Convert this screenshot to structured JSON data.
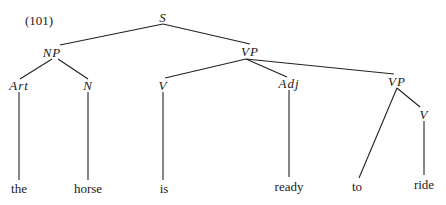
{
  "example_number": "(101)",
  "nodes": {
    "S": {
      "label": "S",
      "x": 163,
      "y": 17
    },
    "NP": {
      "label": "NP",
      "x": 52,
      "y": 52
    },
    "VP1": {
      "label": "VP",
      "x": 250,
      "y": 51
    },
    "Art": {
      "label": "Art",
      "x": 19,
      "y": 85
    },
    "N": {
      "label": "N",
      "x": 88,
      "y": 85
    },
    "V1": {
      "label": "V",
      "x": 163,
      "y": 85
    },
    "Adj": {
      "label": "Adj",
      "x": 289,
      "y": 83
    },
    "VP2": {
      "label": "VP",
      "x": 397,
      "y": 81
    },
    "V2": {
      "label": "V",
      "x": 424,
      "y": 114
    }
  },
  "leaves": {
    "the": {
      "label": "the",
      "x": 19,
      "y": 188
    },
    "horse": {
      "label": "horse",
      "x": 88,
      "y": 188
    },
    "is": {
      "label": "is",
      "x": 164,
      "y": 188
    },
    "ready": {
      "label": "ready",
      "x": 289,
      "y": 186
    },
    "to": {
      "label": "to",
      "x": 357,
      "y": 186
    },
    "ride": {
      "label": "ride",
      "x": 424,
      "y": 184
    }
  },
  "edges": [
    {
      "from": "S",
      "to": "NP",
      "x1": 163,
      "y1": 24,
      "x2": 60,
      "y2": 45
    },
    {
      "from": "S",
      "to": "VP1",
      "x1": 163,
      "y1": 24,
      "x2": 250,
      "y2": 44
    },
    {
      "from": "NP",
      "to": "Art",
      "x1": 52,
      "y1": 59,
      "x2": 20,
      "y2": 79
    },
    {
      "from": "NP",
      "to": "N",
      "x1": 58,
      "y1": 59,
      "x2": 88,
      "y2": 79
    },
    {
      "from": "VP1",
      "to": "V1",
      "x1": 246,
      "y1": 59,
      "x2": 165,
      "y2": 78
    },
    {
      "from": "VP1",
      "to": "Adj",
      "x1": 246,
      "y1": 59,
      "x2": 287,
      "y2": 77
    },
    {
      "from": "VP1",
      "to": "VP2",
      "x1": 246,
      "y1": 59,
      "x2": 394,
      "y2": 74
    },
    {
      "from": "VP2",
      "to": "to",
      "x1": 397,
      "y1": 88,
      "x2": 359,
      "y2": 178
    },
    {
      "from": "VP2",
      "to": "V2",
      "x1": 397,
      "y1": 88,
      "x2": 420,
      "y2": 107
    },
    {
      "from": "Art",
      "to": "the",
      "x1": 19,
      "y1": 92,
      "x2": 19,
      "y2": 180
    },
    {
      "from": "N",
      "to": "horse",
      "x1": 88,
      "y1": 92,
      "x2": 88,
      "y2": 180
    },
    {
      "from": "V1",
      "to": "is",
      "x1": 163,
      "y1": 92,
      "x2": 163,
      "y2": 180
    },
    {
      "from": "Adj",
      "to": "ready",
      "x1": 289,
      "y1": 90,
      "x2": 289,
      "y2": 177
    },
    {
      "from": "V2",
      "to": "ride",
      "x1": 424,
      "y1": 121,
      "x2": 424,
      "y2": 175
    }
  ]
}
